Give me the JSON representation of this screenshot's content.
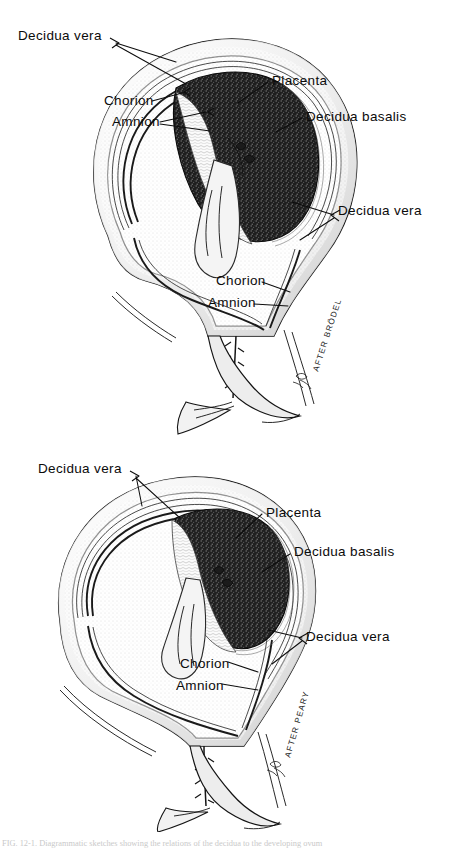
{
  "figure": {
    "background_color": "#ffffff",
    "ink_color": "#111111",
    "placenta_fill": "#1b1b1b",
    "panels": [
      {
        "id": "upper",
        "attribution": "AFTER BRÖDEL",
        "labels": [
          {
            "key": "decidua-vera-top",
            "text": "Decidua vera",
            "x": 18,
            "y": 40
          },
          {
            "key": "chorion-upper",
            "text": "Chorion",
            "x": 104,
            "y": 105
          },
          {
            "key": "amnion-upper",
            "text": "Amnion",
            "x": 112,
            "y": 126
          },
          {
            "key": "placenta",
            "text": "Placenta",
            "x": 272,
            "y": 85
          },
          {
            "key": "decidua-basalis",
            "text": "Decidua basalis",
            "x": 306,
            "y": 121
          },
          {
            "key": "decidua-vera-right",
            "text": "Decidua vera",
            "x": 338,
            "y": 215
          },
          {
            "key": "chorion-lower",
            "text": "Chorion",
            "x": 216,
            "y": 285
          },
          {
            "key": "amnion-lower",
            "text": "Amnion",
            "x": 208,
            "y": 307
          }
        ]
      },
      {
        "id": "lower",
        "attribution": "AFTER PEARY",
        "labels": [
          {
            "key": "decidua-vera-top",
            "text": "Decidua vera",
            "x": 38,
            "y": 473
          },
          {
            "key": "placenta",
            "text": "Placenta",
            "x": 266,
            "y": 517
          },
          {
            "key": "decidua-basalis",
            "text": "Decidua basalis",
            "x": 294,
            "y": 556
          },
          {
            "key": "decidua-vera-right",
            "text": "Decidua vera",
            "x": 306,
            "y": 641
          },
          {
            "key": "chorion",
            "text": "Chorion",
            "x": 180,
            "y": 668
          },
          {
            "key": "amnion",
            "text": "Amnion",
            "x": 176,
            "y": 690
          }
        ]
      }
    ]
  },
  "caption": {
    "text": "FIG. 12-1.   Diagrammatic sketches showing the relations of the decidua to the developing ovum"
  }
}
